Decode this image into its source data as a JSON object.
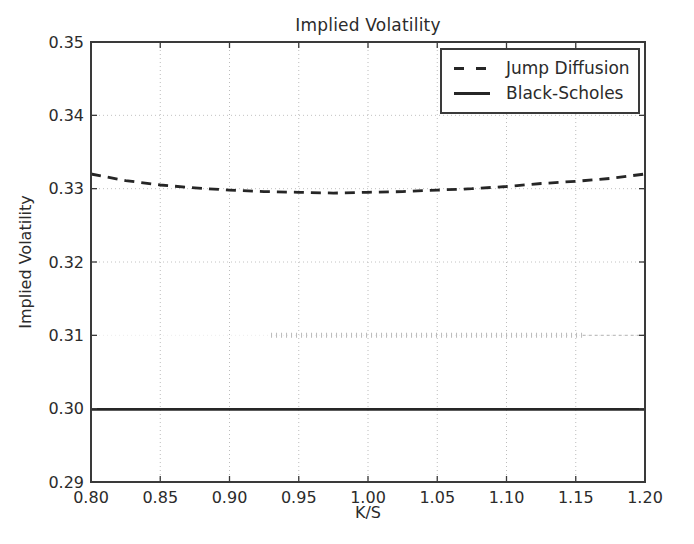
{
  "figure": {
    "background": "#ffffff",
    "ink_color": "#2b2b2b",
    "grid_color": "#bcbcbc",
    "spine_color": "#3a3a3a"
  },
  "chart_data": {
    "type": "line",
    "title": "Implied Volatility",
    "xlabel": "K/S",
    "ylabel": "Implied Volatility",
    "xlim": [
      0.8,
      1.2
    ],
    "ylim": [
      0.29,
      0.35
    ],
    "xticks": [
      0.8,
      0.85,
      0.9,
      0.95,
      1.0,
      1.05,
      1.1,
      1.15,
      1.2
    ],
    "xtick_labels": [
      "0.80",
      "0.85",
      "0.90",
      "0.95",
      "1.00",
      "1.05",
      "1.10",
      "1.15",
      "1.20"
    ],
    "yticks": [
      0.29,
      0.3,
      0.31,
      0.32,
      0.33,
      0.34,
      0.35
    ],
    "ytick_labels": [
      "0.29",
      "0.30",
      "0.31",
      "0.32",
      "0.33",
      "0.34",
      "0.35"
    ],
    "grid": true,
    "grid_style": "dotted",
    "legend_position": "upper right",
    "series": [
      {
        "name": "Jump Diffusion",
        "style": "dashed",
        "color": "#262626",
        "x": [
          0.8,
          0.825,
          0.85,
          0.875,
          0.9,
          0.925,
          0.95,
          0.975,
          1.0,
          1.025,
          1.05,
          1.075,
          1.1,
          1.125,
          1.15,
          1.175,
          1.2
        ],
        "y": [
          0.332,
          0.3311,
          0.3305,
          0.3301,
          0.3298,
          0.3296,
          0.3295,
          0.3294,
          0.3295,
          0.3296,
          0.3298,
          0.33,
          0.3303,
          0.3307,
          0.331,
          0.3314,
          0.332
        ]
      },
      {
        "name": "Black-Scholes",
        "style": "solid",
        "color": "#262626",
        "x": [
          0.8,
          1.2
        ],
        "y": [
          0.2999,
          0.2999
        ]
      }
    ],
    "scan_artifact": {
      "description": "faint tick-like marks along the 0.31 gridline (scan artifact)",
      "y": 0.31,
      "x_start": 0.93,
      "x_end": 1.155,
      "tail_x_end": 1.2,
      "color": "#b4b4b4"
    }
  }
}
